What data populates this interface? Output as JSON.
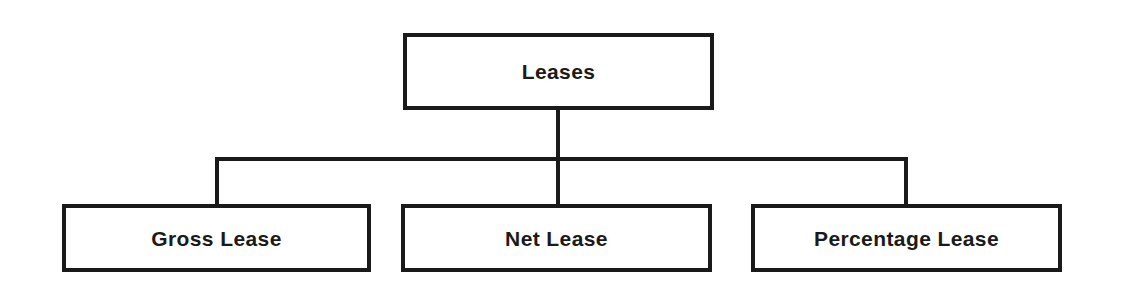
{
  "diagram": {
    "title": "Leases",
    "type": "hierarchy-tree",
    "background_color": "#ffffff",
    "line_color": "#1a1a1a",
    "text_color": "#1a1a1a",
    "root": {
      "label": "Leases"
    },
    "children": [
      {
        "label": "Gross Lease"
      },
      {
        "label": "Net Lease"
      },
      {
        "label": "Percentage Lease"
      }
    ]
  }
}
